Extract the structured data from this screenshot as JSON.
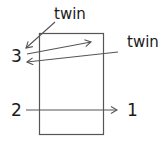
{
  "diagram": {
    "labels": {
      "twin_top": "twin",
      "twin_right": "twin",
      "num_3": "3",
      "num_2": "2",
      "num_1": "1"
    },
    "colors": {
      "stroke": "#555555",
      "text": "#1a1a1a",
      "background": "#ffffff"
    },
    "box": {
      "x": 39,
      "y": 33,
      "width": 64,
      "height": 101
    },
    "arrows": [
      {
        "name": "twin-top-to-3",
        "from": [
          55,
          22
        ],
        "to": [
          26,
          48
        ]
      },
      {
        "name": "3-to-inside-box",
        "from": [
          27,
          54
        ],
        "to": [
          91,
          42
        ]
      },
      {
        "name": "twin-right-to-3",
        "from": [
          118,
          52
        ],
        "to": [
          27,
          62
        ]
      },
      {
        "name": "2-to-1",
        "from": [
          26,
          110
        ],
        "to": [
          117,
          110
        ]
      }
    ]
  }
}
